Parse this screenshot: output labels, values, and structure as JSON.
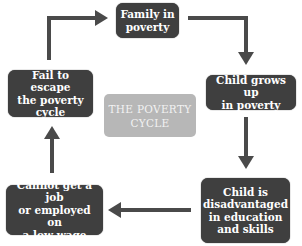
{
  "diagram": {
    "title": "THE POVERTY\nCYCLE",
    "nodes": [
      {
        "id": "family",
        "label": "Family in\npoverty"
      },
      {
        "id": "grows",
        "label": "Child grows up\nin poverty"
      },
      {
        "id": "disadvantaged",
        "label": "Child is\ndisadvantaged\nin education\nand skills"
      },
      {
        "id": "job",
        "label": "Cannot get a job\nor employed on\na low wage"
      },
      {
        "id": "fail",
        "label": "Fail to escape\nthe poverty\ncycle"
      }
    ],
    "edges": [
      {
        "from": "family",
        "to": "grows"
      },
      {
        "from": "grows",
        "to": "disadvantaged"
      },
      {
        "from": "disadvantaged",
        "to": "job"
      },
      {
        "from": "job",
        "to": "fail"
      },
      {
        "from": "fail",
        "to": "family"
      }
    ],
    "colors": {
      "node_fill": "#3f3f3f",
      "node_text": "#ffffff",
      "center_fill": "#b7b7b7",
      "center_text": "#f2f2f2",
      "arrow": "#4a4a4a"
    }
  }
}
